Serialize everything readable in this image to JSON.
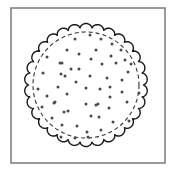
{
  "figure": {
    "background": "#ffffff",
    "frame": {
      "x": 11,
      "y": 8,
      "width": 154,
      "height": 155,
      "stroke": "#7a7a7a",
      "stroke_width": 1.5
    },
    "cracker": {
      "cx": 86,
      "cy": 85,
      "outer_radius": 60,
      "scallop_count": 30,
      "scallop_depth": 2.6,
      "outer_stroke": "#1a1a1a",
      "outer_stroke_width": 1.4,
      "inner_radius": 53,
      "inner_dash": "4 3",
      "inner_stroke": "#333333",
      "inner_stroke_width": 1.1,
      "hole_color": "#4a4a4a",
      "hole_radius": 1.5,
      "holes": [
        [
          75,
          39
        ],
        [
          90,
          35
        ],
        [
          101,
          39
        ],
        [
          112,
          44
        ],
        [
          67,
          50
        ],
        [
          79,
          54
        ],
        [
          96,
          50
        ],
        [
          121,
          50
        ],
        [
          47,
          57
        ],
        [
          111,
          56
        ],
        [
          91,
          59
        ],
        [
          60,
          63
        ],
        [
          62,
          63
        ],
        [
          102,
          64
        ],
        [
          125,
          60
        ],
        [
          116,
          63
        ],
        [
          131,
          64
        ],
        [
          71,
          69
        ],
        [
          79,
          69
        ],
        [
          43,
          73
        ],
        [
          61,
          74
        ],
        [
          65,
          76
        ],
        [
          90,
          76
        ],
        [
          107,
          78
        ],
        [
          128,
          72
        ],
        [
          122,
          80
        ],
        [
          76,
          82
        ],
        [
          38,
          89
        ],
        [
          58,
          87
        ],
        [
          86,
          88
        ],
        [
          100,
          89
        ],
        [
          110,
          87
        ],
        [
          122,
          92
        ],
        [
          139,
          93
        ],
        [
          67,
          94
        ],
        [
          47,
          96
        ],
        [
          110,
          97
        ],
        [
          54,
          103
        ],
        [
          86,
          104
        ],
        [
          98,
          104
        ],
        [
          127,
          102
        ],
        [
          42,
          107
        ],
        [
          68,
          111
        ],
        [
          109,
          108
        ],
        [
          91,
          116
        ],
        [
          99,
          117
        ],
        [
          52,
          118
        ],
        [
          113,
          122
        ],
        [
          129,
          121
        ],
        [
          62,
          125
        ],
        [
          77,
          126
        ],
        [
          87,
          132
        ],
        [
          101,
          130
        ],
        [
          61,
          137
        ],
        [
          75,
          138
        ],
        [
          88,
          137
        ],
        [
          55,
          102
        ],
        [
          64,
          112
        ],
        [
          96,
          105
        ]
      ]
    }
  }
}
